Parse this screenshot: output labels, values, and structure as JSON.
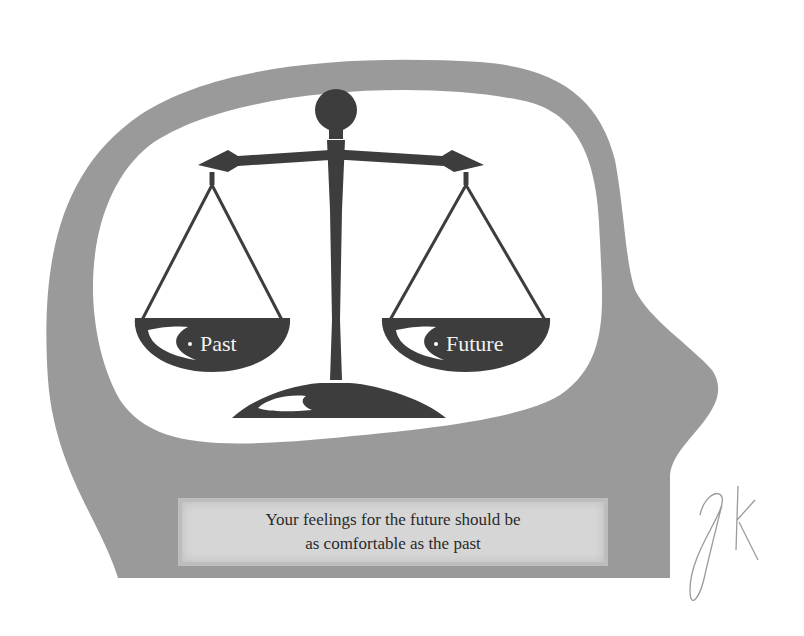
{
  "illustration": {
    "subject": "Balance scale inside a human head silhouette",
    "left_pan_label": "Past",
    "right_pan_label": "Future",
    "caption": {
      "line1": "Your feelings for the future should be",
      "line2": "as comfortable as the past"
    },
    "signature": "JK",
    "colors": {
      "head_fill": "#9a9a9a",
      "inner_fill": "#ffffff",
      "scale_fill": "#3d3d3d",
      "caption_bg": "#d6d6d6",
      "caption_text": "#2a2a2a",
      "label_text": "#f2f2f2"
    }
  }
}
